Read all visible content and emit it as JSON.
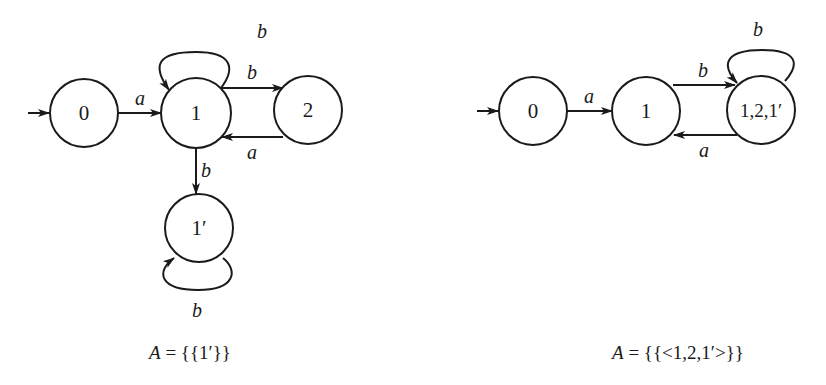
{
  "left_diagram": {
    "states": [
      {
        "id": "0",
        "label": "0",
        "initial": true
      },
      {
        "id": "1",
        "label": "1"
      },
      {
        "id": "2",
        "label": "2"
      },
      {
        "id": "1p",
        "label": "1′"
      }
    ],
    "edges": [
      {
        "from": "0",
        "to": "1",
        "label": "a"
      },
      {
        "from": "1",
        "to": "1",
        "label": "b"
      },
      {
        "from": "1",
        "to": "2",
        "label": "b"
      },
      {
        "from": "2",
        "to": "1",
        "label": "a"
      },
      {
        "from": "1",
        "to": "1p",
        "label": "b"
      },
      {
        "from": "1p",
        "to": "1p",
        "label": "b"
      }
    ],
    "caption": {
      "italic_part": "A",
      "rest": " = {{1′}}"
    }
  },
  "right_diagram": {
    "states": [
      {
        "id": "0",
        "label": "0",
        "initial": true
      },
      {
        "id": "1",
        "label": "1"
      },
      {
        "id": "12p",
        "label": "1,2,1′"
      }
    ],
    "edges": [
      {
        "from": "0",
        "to": "1",
        "label": "a"
      },
      {
        "from": "1",
        "to": "12p",
        "label": "b"
      },
      {
        "from": "12p",
        "to": "1",
        "label": "a"
      },
      {
        "from": "12p",
        "to": "12p",
        "label": "b"
      }
    ],
    "caption": {
      "italic_part": "A",
      "rest": " = {{<1,2,1′>}}"
    }
  }
}
